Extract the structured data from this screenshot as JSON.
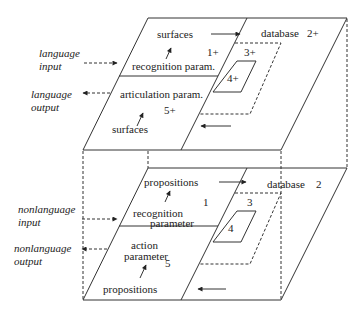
{
  "top_plane": {
    "name": "language",
    "input_label": [
      "language",
      "input"
    ],
    "output_label": [
      "language",
      "output"
    ],
    "upper_surfaces": "surfaces",
    "recognition": "recognition param.",
    "articulation": "articulation param.",
    "lower_surfaces": "surfaces",
    "database": "database",
    "database_num": "2+",
    "region_1": "1+",
    "region_3": "3+",
    "region_4": "4+",
    "region_5": "5+"
  },
  "bottom_plane": {
    "name": "nonlanguage",
    "input_label": [
      "nonlanguage",
      "input"
    ],
    "output_label": [
      "nonlanguage",
      "output"
    ],
    "upper_propositions": "propositions",
    "recognition": [
      "recognition",
      "parameter"
    ],
    "action": [
      "action",
      "parameter"
    ],
    "lower_propositions": "propositions",
    "database": "database",
    "database_num": "2",
    "region_1": "1",
    "region_3": "3",
    "region_4": "4",
    "region_5": "5"
  }
}
